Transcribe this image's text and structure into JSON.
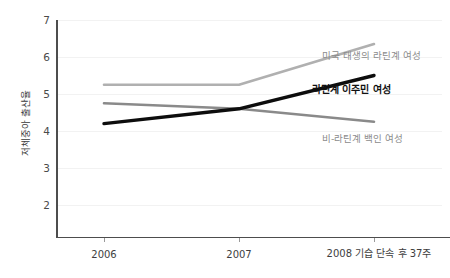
{
  "chart_data": {
    "type": "line",
    "title": "",
    "xlabel": "",
    "ylabel": "저체중아 출산율",
    "categories": [
      "2006",
      "2007",
      "2008 기습 단속 후 37주"
    ],
    "ylim": [
      1.6,
      7.4
    ],
    "yticks": [
      2,
      3,
      4,
      5,
      6,
      7
    ],
    "grid": true,
    "legend_position": "inline-right",
    "series": [
      {
        "name": "미국 태생의 라틴계 여성",
        "color": "#b0b0b0",
        "weight": "normal",
        "values": [
          5.25,
          5.25,
          6.35
        ]
      },
      {
        "name": "라틴계 이주민 여성",
        "color": "#0d0d0d",
        "weight": "bold",
        "values": [
          4.2,
          4.6,
          5.5
        ]
      },
      {
        "name": "비-라틴계 백인 여성",
        "color": "#8a8a8a",
        "weight": "normal",
        "values": [
          4.75,
          4.6,
          4.25
        ]
      }
    ]
  },
  "axis": {
    "y_tick_labels": [
      "7",
      "6",
      "5",
      "4",
      "3",
      "2"
    ],
    "y_axis_title": "저체중아 출산율",
    "x_tick_labels": [
      "2006",
      "2007",
      "2008 기습 단속 후 37주"
    ]
  },
  "series_labels": {
    "us_born_latina": "미국 태생의 라틴계 여성",
    "latina_immigrant": "라틴계 이주민 여성",
    "non_latina_white": "비-라틴계 백인 여성"
  }
}
